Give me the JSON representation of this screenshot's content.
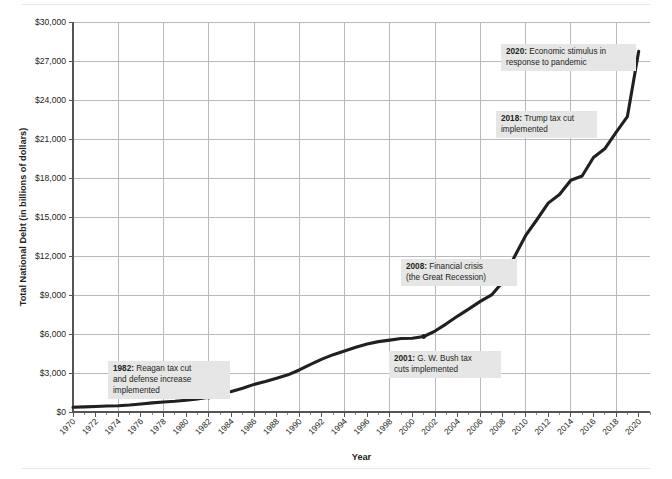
{
  "chart_data": {
    "type": "line",
    "title": "",
    "xlabel": "Year",
    "ylabel": "Total National Debt (in billions of dollars)",
    "xlim": [
      1970,
      2021
    ],
    "ylim": [
      0,
      30000
    ],
    "ytick_step": 3000,
    "xtick_step": 2,
    "grid": true,
    "legend": "none",
    "yticks": [
      "$0",
      "$3,000",
      "$6,000",
      "$9,000",
      "$12,000",
      "$15,000",
      "$18,000",
      "$21,000",
      "$24,000",
      "$27,000",
      "$30,000"
    ],
    "ytick_values": [
      0,
      3000,
      6000,
      9000,
      12000,
      15000,
      18000,
      21000,
      24000,
      27000,
      30000
    ],
    "xticks": [
      "1970",
      "1972",
      "1974",
      "1976",
      "1978",
      "1980",
      "1982",
      "1984",
      "1986",
      "1988",
      "1990",
      "1992",
      "1994",
      "1996",
      "1998",
      "2000",
      "2002",
      "2004",
      "2006",
      "2008",
      "2010",
      "2012",
      "2014",
      "2016",
      "2018",
      "2020"
    ],
    "xtick_values": [
      1970,
      1972,
      1974,
      1976,
      1978,
      1980,
      1982,
      1984,
      1986,
      1988,
      1990,
      1992,
      1994,
      1996,
      1998,
      2000,
      2002,
      2004,
      2006,
      2008,
      2010,
      2012,
      2014,
      2016,
      2018,
      2020
    ],
    "x": [
      1970,
      1971,
      1972,
      1973,
      1974,
      1975,
      1976,
      1977,
      1978,
      1979,
      1980,
      1981,
      1982,
      1983,
      1984,
      1985,
      1986,
      1987,
      1988,
      1989,
      1990,
      1991,
      1992,
      1993,
      1994,
      1995,
      1996,
      1997,
      1998,
      1999,
      2000,
      2001,
      2002,
      2003,
      2004,
      2005,
      2006,
      2007,
      2008,
      2009,
      2010,
      2011,
      2012,
      2013,
      2014,
      2015,
      2016,
      2017,
      2018,
      2019,
      2020
    ],
    "values": [
      370,
      398,
      427,
      458,
      475,
      533,
      620,
      699,
      772,
      827,
      908,
      998,
      1142,
      1377,
      1572,
      1823,
      2125,
      2350,
      2602,
      2857,
      3233,
      3665,
      4065,
      4411,
      4693,
      4974,
      5225,
      5413,
      5526,
      5656,
      5674,
      5807,
      6228,
      6783,
      7379,
      7933,
      8507,
      9008,
      10025,
      11910,
      13562,
      14790,
      16066,
      16738,
      17824,
      18151,
      19573,
      20245,
      21516,
      22719,
      27748
    ],
    "series": [
      {
        "name": "Total National Debt",
        "color": "#231f20",
        "values": [
          370,
          398,
          427,
          458,
          475,
          533,
          620,
          699,
          772,
          827,
          908,
          998,
          1142,
          1377,
          1572,
          1823,
          2125,
          2350,
          2602,
          2857,
          3233,
          3665,
          4065,
          4411,
          4693,
          4974,
          5225,
          5413,
          5526,
          5656,
          5674,
          5807,
          6228,
          6783,
          7379,
          7933,
          8507,
          9008,
          10025,
          11910,
          13562,
          14790,
          16066,
          16738,
          17824,
          18151,
          19573,
          20245,
          21516,
          22719,
          27748
        ]
      }
    ],
    "markers": [
      {
        "year": 1982,
        "value": 1142
      },
      {
        "year": 2001,
        "value": 5807
      }
    ],
    "annotations": [
      {
        "id": "ann-1982",
        "year_label": "1982",
        "separator": ": ",
        "lines": [
          "Reagan tax cut",
          "and defense increase",
          "implemented"
        ],
        "first_line_rest": "Reagan tax cut",
        "box_x": 108,
        "box_y": 361,
        "box_w": 122,
        "box_h": 38
      },
      {
        "id": "ann-2001",
        "year_label": "2001",
        "separator": ": ",
        "lines": [
          "G. W. Bush tax",
          "cuts implemented"
        ],
        "first_line_rest": "G. W. Bush tax",
        "box_x": 389,
        "box_y": 351,
        "box_w": 112,
        "box_h": 27
      },
      {
        "id": "ann-2008",
        "year_label": "2008",
        "separator": ": ",
        "lines": [
          "Financial crisis",
          "(the Great Recession)"
        ],
        "first_line_rest": "Financial crisis",
        "box_x": 401,
        "box_y": 259,
        "box_w": 116,
        "box_h": 27
      },
      {
        "id": "ann-2018",
        "year_label": "2018",
        "separator": ": ",
        "lines": [
          "Trump tax cut",
          "implemented"
        ],
        "first_line_rest": "Trump tax cut",
        "box_x": 496,
        "box_y": 111,
        "box_w": 101,
        "box_h": 27
      },
      {
        "id": "ann-2020",
        "year_label": "2020",
        "separator": ": ",
        "lines": [
          "Economic stimulus in",
          "response to pandemic"
        ],
        "first_line_rest": "Economic stimulus in",
        "box_x": 501,
        "box_y": 44,
        "box_w": 135,
        "box_h": 27
      }
    ]
  }
}
